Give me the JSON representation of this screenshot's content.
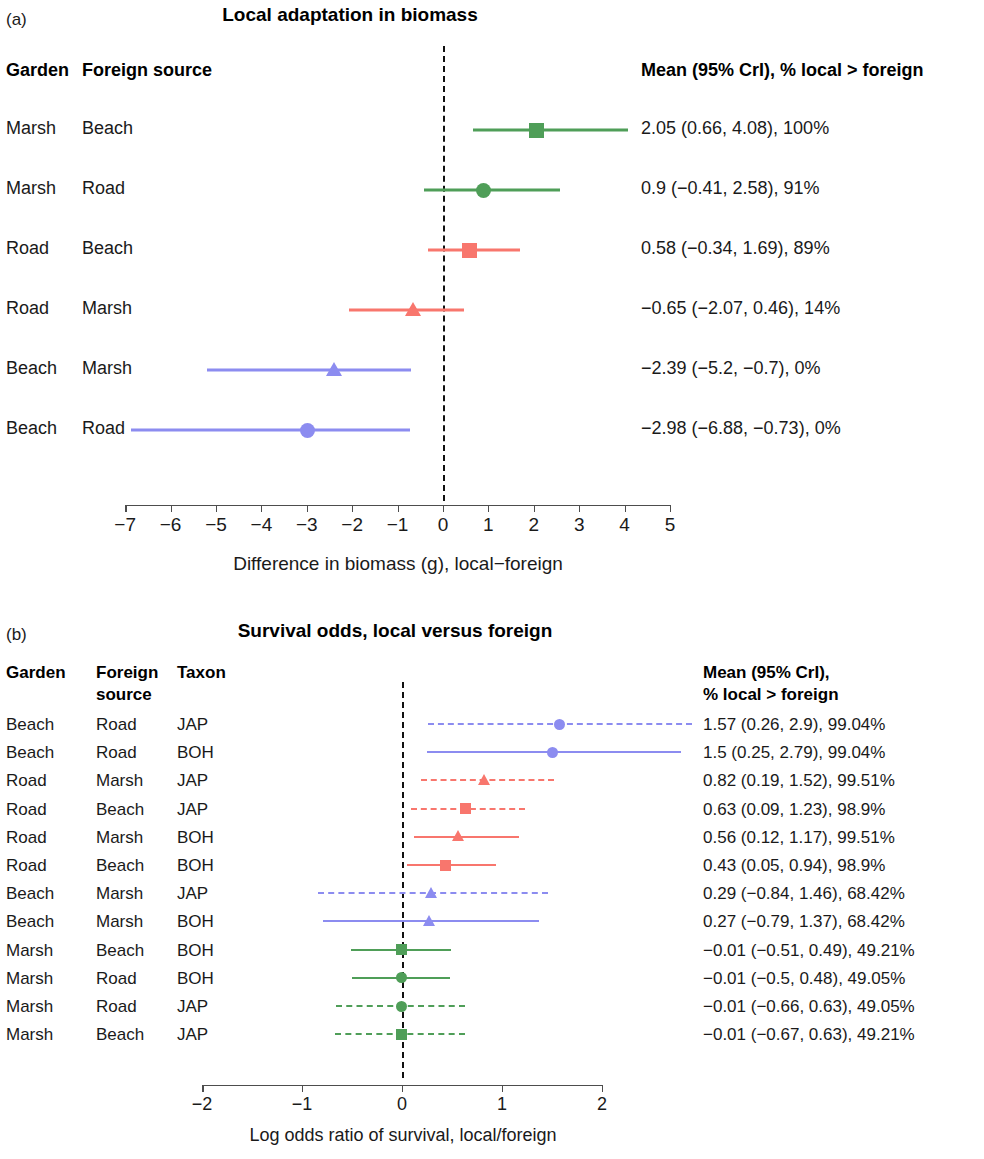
{
  "colors": {
    "marsh": "#4f9e58",
    "road": "#f8766d",
    "beach": "#8c8cf0",
    "zero_line": "#111111",
    "axis": "#4d4d4d"
  },
  "panel_a": {
    "letter": "(a)",
    "title": "Local adaptation in biomass",
    "headers": {
      "garden": "Garden",
      "foreign_source": "Foreign source",
      "stats": "Mean (95% CrI),  % local > foreign"
    },
    "xlabel": "Difference in biomass (g), local−foreign",
    "ticks": [
      "−7",
      "−6",
      "−5",
      "−4",
      "−3",
      "−2",
      "−1",
      "0",
      "1",
      "2",
      "3",
      "4",
      "5"
    ],
    "rows": [
      {
        "garden": "Marsh",
        "source": "Beach",
        "stats": "2.05 (0.66, 4.08), 100%"
      },
      {
        "garden": "Marsh",
        "source": "Road",
        "stats": "0.9 (−0.41, 2.58), 91%"
      },
      {
        "garden": "Road",
        "source": "Beach",
        "stats": "0.58 (−0.34, 1.69), 89%"
      },
      {
        "garden": "Road",
        "source": "Marsh",
        "stats": "−0.65 (−2.07, 0.46), 14%"
      },
      {
        "garden": "Beach",
        "source": "Marsh",
        "stats": "−2.39 (−5.2, −0.7), 0%"
      },
      {
        "garden": "Beach",
        "source": "Road",
        "stats": "−2.98 (−6.88, −0.73), 0%"
      }
    ]
  },
  "panel_b": {
    "letter": "(b)",
    "title": "Survival odds, local versus foreign",
    "headers": {
      "garden": "Garden",
      "foreign_source_line1": "Foreign",
      "foreign_source_line2": "source",
      "taxon": "Taxon",
      "stats_line1": "Mean (95% CrI),",
      "stats_line2": "% local > foreign"
    },
    "xlabel": "Log odds ratio of survival, local/foreign",
    "ticks": [
      "−2",
      "−1",
      "0",
      "1",
      "2"
    ],
    "rows": [
      {
        "garden": "Beach",
        "source": "Road",
        "taxon": "JAP",
        "stats": "1.57 (0.26, 2.9), 99.04%"
      },
      {
        "garden": "Beach",
        "source": "Road",
        "taxon": "BOH",
        "stats": "1.5 (0.25, 2.79), 99.04%"
      },
      {
        "garden": "Road",
        "source": "Marsh",
        "taxon": "JAP",
        "stats": "0.82 (0.19, 1.52), 99.51%"
      },
      {
        "garden": "Road",
        "source": "Beach",
        "taxon": "JAP",
        "stats": "0.63 (0.09, 1.23), 98.9%"
      },
      {
        "garden": "Road",
        "source": "Marsh",
        "taxon": "BOH",
        "stats": "0.56 (0.12, 1.17), 99.51%"
      },
      {
        "garden": "Road",
        "source": "Beach",
        "taxon": "BOH",
        "stats": "0.43 (0.05, 0.94), 98.9%"
      },
      {
        "garden": "Beach",
        "source": "Marsh",
        "taxon": "JAP",
        "stats": "0.29 (−0.84, 1.46), 68.42%"
      },
      {
        "garden": "Beach",
        "source": "Marsh",
        "taxon": "BOH",
        "stats": "0.27 (−0.79, 1.37), 68.42%"
      },
      {
        "garden": "Marsh",
        "source": "Beach",
        "taxon": "BOH",
        "stats": "−0.01 (−0.51, 0.49), 49.21%"
      },
      {
        "garden": "Marsh",
        "source": "Road",
        "taxon": "BOH",
        "stats": "−0.01 (−0.5, 0.48), 49.05%"
      },
      {
        "garden": "Marsh",
        "source": "Road",
        "taxon": "JAP",
        "stats": "−0.01 (−0.66, 0.63), 49.05%"
      },
      {
        "garden": "Marsh",
        "source": "Beach",
        "taxon": "JAP",
        "stats": "−0.01 (−0.67, 0.63), 49.21%"
      }
    ]
  },
  "chart_data": [
    {
      "type": "forest",
      "panel": "a",
      "title": "Local adaptation in biomass",
      "xlabel": "Difference in biomass (g), local−foreign",
      "ylabel": "",
      "xlim": [
        -7,
        5
      ],
      "xticks": [
        -7,
        -6,
        -5,
        -4,
        -3,
        -2,
        -1,
        0,
        1,
        2,
        3,
        4,
        5
      ],
      "grid": false,
      "reference_line": 0,
      "legend": "none",
      "points": [
        {
          "garden": "Marsh",
          "source": "Beach",
          "mean": 2.05,
          "lower": 0.66,
          "upper": 4.08,
          "pct_local_gt_foreign": 100,
          "color": "#4f9e58",
          "marker": "square"
        },
        {
          "garden": "Marsh",
          "source": "Road",
          "mean": 0.9,
          "lower": -0.41,
          "upper": 2.58,
          "pct_local_gt_foreign": 91,
          "color": "#4f9e58",
          "marker": "circle"
        },
        {
          "garden": "Road",
          "source": "Beach",
          "mean": 0.58,
          "lower": -0.34,
          "upper": 1.69,
          "pct_local_gt_foreign": 89,
          "color": "#f8766d",
          "marker": "square"
        },
        {
          "garden": "Road",
          "source": "Marsh",
          "mean": -0.65,
          "lower": -2.07,
          "upper": 0.46,
          "pct_local_gt_foreign": 14,
          "color": "#f8766d",
          "marker": "triangle"
        },
        {
          "garden": "Beach",
          "source": "Marsh",
          "mean": -2.39,
          "lower": -5.2,
          "upper": -0.7,
          "pct_local_gt_foreign": 0,
          "color": "#8c8cf0",
          "marker": "triangle"
        },
        {
          "garden": "Beach",
          "source": "Road",
          "mean": -2.98,
          "lower": -6.88,
          "upper": -0.73,
          "pct_local_gt_foreign": 0,
          "color": "#8c8cf0",
          "marker": "circle"
        }
      ]
    },
    {
      "type": "forest",
      "panel": "b",
      "title": "Survival odds, local versus foreign",
      "xlabel": "Log odds ratio of survival, local/foreign",
      "ylabel": "",
      "xlim": [
        -2,
        2
      ],
      "xticks": [
        -2,
        -1,
        0,
        1,
        2
      ],
      "grid": false,
      "reference_line": 0,
      "legend": "none",
      "points": [
        {
          "garden": "Beach",
          "source": "Road",
          "taxon": "JAP",
          "mean": 1.57,
          "lower": 0.26,
          "upper": 2.9,
          "pct_local_gt_foreign": 99.04,
          "color": "#8c8cf0",
          "marker": "circle",
          "linestyle": "dashed"
        },
        {
          "garden": "Beach",
          "source": "Road",
          "taxon": "BOH",
          "mean": 1.5,
          "lower": 0.25,
          "upper": 2.79,
          "pct_local_gt_foreign": 99.04,
          "color": "#8c8cf0",
          "marker": "circle",
          "linestyle": "solid"
        },
        {
          "garden": "Road",
          "source": "Marsh",
          "taxon": "JAP",
          "mean": 0.82,
          "lower": 0.19,
          "upper": 1.52,
          "pct_local_gt_foreign": 99.51,
          "color": "#f8766d",
          "marker": "triangle",
          "linestyle": "dashed"
        },
        {
          "garden": "Road",
          "source": "Beach",
          "taxon": "JAP",
          "mean": 0.63,
          "lower": 0.09,
          "upper": 1.23,
          "pct_local_gt_foreign": 98.9,
          "color": "#f8766d",
          "marker": "square",
          "linestyle": "dashed"
        },
        {
          "garden": "Road",
          "source": "Marsh",
          "taxon": "BOH",
          "mean": 0.56,
          "lower": 0.12,
          "upper": 1.17,
          "pct_local_gt_foreign": 99.51,
          "color": "#f8766d",
          "marker": "triangle",
          "linestyle": "solid"
        },
        {
          "garden": "Road",
          "source": "Beach",
          "taxon": "BOH",
          "mean": 0.43,
          "lower": 0.05,
          "upper": 0.94,
          "pct_local_gt_foreign": 98.9,
          "color": "#f8766d",
          "marker": "square",
          "linestyle": "solid"
        },
        {
          "garden": "Beach",
          "source": "Marsh",
          "taxon": "JAP",
          "mean": 0.29,
          "lower": -0.84,
          "upper": 1.46,
          "pct_local_gt_foreign": 68.42,
          "color": "#8c8cf0",
          "marker": "triangle",
          "linestyle": "dashed"
        },
        {
          "garden": "Beach",
          "source": "Marsh",
          "taxon": "BOH",
          "mean": 0.27,
          "lower": -0.79,
          "upper": 1.37,
          "pct_local_gt_foreign": 68.42,
          "color": "#8c8cf0",
          "marker": "triangle",
          "linestyle": "solid"
        },
        {
          "garden": "Marsh",
          "source": "Beach",
          "taxon": "BOH",
          "mean": -0.01,
          "lower": -0.51,
          "upper": 0.49,
          "pct_local_gt_foreign": 49.21,
          "color": "#4f9e58",
          "marker": "square",
          "linestyle": "solid"
        },
        {
          "garden": "Marsh",
          "source": "Road",
          "taxon": "BOH",
          "mean": -0.01,
          "lower": -0.5,
          "upper": 0.48,
          "pct_local_gt_foreign": 49.05,
          "color": "#4f9e58",
          "marker": "circle",
          "linestyle": "solid"
        },
        {
          "garden": "Marsh",
          "source": "Road",
          "taxon": "JAP",
          "mean": -0.01,
          "lower": -0.66,
          "upper": 0.63,
          "pct_local_gt_foreign": 49.05,
          "color": "#4f9e58",
          "marker": "circle",
          "linestyle": "dashed"
        },
        {
          "garden": "Marsh",
          "source": "Beach",
          "taxon": "JAP",
          "mean": -0.01,
          "lower": -0.67,
          "upper": 0.63,
          "pct_local_gt_foreign": 49.21,
          "color": "#4f9e58",
          "marker": "square",
          "linestyle": "dashed"
        }
      ]
    }
  ]
}
